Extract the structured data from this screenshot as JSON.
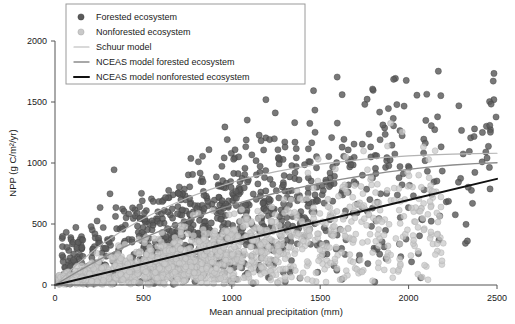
{
  "chart_data": {
    "type": "scatter",
    "title": "",
    "xlabel": "Mean annual precipitation (mm)",
    "ylabel": "NPP (g C/m2/yr)",
    "ylabel_display": "NPP (g C/m²/yr)",
    "xlim": [
      0,
      2500
    ],
    "ylim": [
      0,
      2000
    ],
    "xticks": [
      0,
      500,
      1000,
      1500,
      2000,
      2500
    ],
    "yticks": [
      0,
      500,
      1000,
      1500,
      2000
    ],
    "grid": false,
    "legend_position": "top-left",
    "legend_entries": [
      {
        "label": "Forested ecosystem",
        "marker": "circle",
        "color": "#5a5a5a",
        "kind": "marker"
      },
      {
        "label": "Nonforested ecosystem",
        "marker": "circle",
        "color": "#c9c9c9",
        "kind": "marker"
      },
      {
        "label": "Schuur model",
        "color": "#b4b4b4",
        "kind": "line",
        "width": 1.2
      },
      {
        "label": "NCEAS model forested ecosystem",
        "color": "#8c8c8c",
        "kind": "line",
        "width": 1.4
      },
      {
        "label": "NCEAS model nonforested ecosystem",
        "color": "#111111",
        "kind": "line",
        "width": 2.0
      }
    ],
    "series": [
      {
        "name": "Forested ecosystem",
        "type": "scatter",
        "color": "#5a5a5a",
        "marker_size": 3.1,
        "n_points": 1150,
        "description": "Dark gray filled circles; broad cloud rising with precipitation, widest spread between 500-1800 mm, upper envelope near 1700 g C/m2/yr",
        "distribution": {
          "x_range": [
            40,
            2500
          ],
          "trend_intercept": 0,
          "trend_slope": 0.4,
          "spread_base": 150,
          "spread_growth": 0.16,
          "x_density_peak": 900
        }
      },
      {
        "name": "Nonforested ecosystem",
        "type": "scatter",
        "color": "#c9c9c9",
        "marker_size": 3.0,
        "n_points": 1500,
        "description": "Light gray circles forming a dense wedge fanning from the origin, concentrated at or below the NCEAS nonforested line, thinning beyond 1500 mm",
        "distribution": {
          "x_range": [
            20,
            2200
          ],
          "trend_intercept": 0,
          "trend_slope": 0.27,
          "spread_base": 40,
          "spread_growth": 0.13,
          "x_density_peak": 700
        }
      }
    ],
    "model_lines": [
      {
        "name": "Schuur model",
        "color": "#b4b4b4",
        "width": 1.2,
        "shape": "saturating",
        "points": [
          [
            0,
            0
          ],
          [
            125,
            170
          ],
          [
            250,
            320
          ],
          [
            375,
            440
          ],
          [
            500,
            545
          ],
          [
            625,
            635
          ],
          [
            750,
            715
          ],
          [
            875,
            782
          ],
          [
            1000,
            840
          ],
          [
            1125,
            890
          ],
          [
            1250,
            930
          ],
          [
            1375,
            963
          ],
          [
            1500,
            990
          ],
          [
            1625,
            1012
          ],
          [
            1750,
            1031
          ],
          [
            1875,
            1046
          ],
          [
            2000,
            1058
          ],
          [
            2125,
            1066
          ],
          [
            2250,
            1072
          ],
          [
            2375,
            1077
          ],
          [
            2500,
            1080
          ]
        ]
      },
      {
        "name": "NCEAS model forested ecosystem",
        "color": "#8c8c8c",
        "width": 1.4,
        "shape": "slightly-saturating",
        "points": [
          [
            0,
            0
          ],
          [
            125,
            108
          ],
          [
            250,
            208
          ],
          [
            375,
            300
          ],
          [
            500,
            385
          ],
          [
            625,
            462
          ],
          [
            750,
            533
          ],
          [
            875,
            597
          ],
          [
            1000,
            655
          ],
          [
            1125,
            707
          ],
          [
            1250,
            754
          ],
          [
            1375,
            796
          ],
          [
            1500,
            834
          ],
          [
            1625,
            868
          ],
          [
            1750,
            898
          ],
          [
            1875,
            925
          ],
          [
            2000,
            948
          ],
          [
            2125,
            968
          ],
          [
            2250,
            984
          ],
          [
            2375,
            995
          ],
          [
            2500,
            1002
          ]
        ]
      },
      {
        "name": "NCEAS model nonforested ecosystem",
        "color": "#111111",
        "width": 2.0,
        "shape": "linear",
        "points": [
          [
            0,
            0
          ],
          [
            500,
            174
          ],
          [
            1000,
            348
          ],
          [
            1500,
            522
          ],
          [
            2000,
            696
          ],
          [
            2500,
            870
          ]
        ]
      }
    ]
  }
}
